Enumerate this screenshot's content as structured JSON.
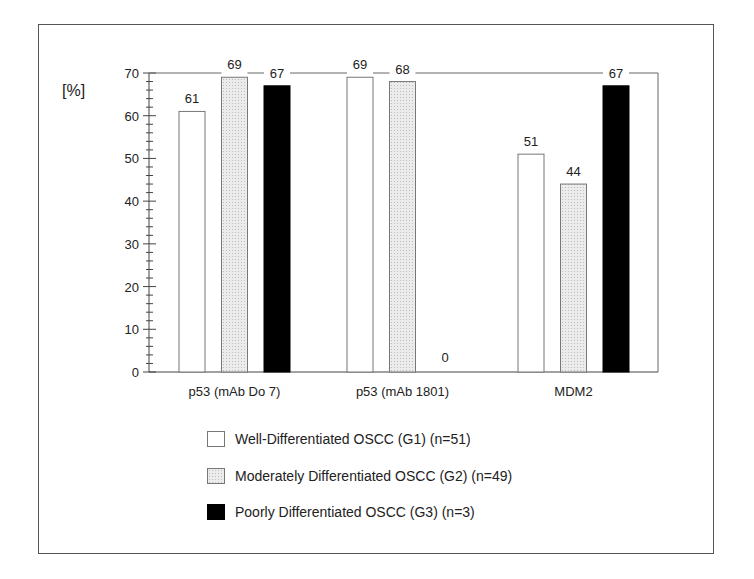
{
  "chart_data": {
    "type": "bar",
    "title": "",
    "xlabel": "",
    "ylabel": "[%]",
    "ylim": [
      0,
      70
    ],
    "yticks": [
      0,
      10,
      20,
      30,
      40,
      50,
      60,
      70
    ],
    "grid": false,
    "legend_position": "bottom",
    "categories": [
      "p53 (mAb Do 7)",
      "p53 (mAb 1801)",
      "MDM2"
    ],
    "series": [
      {
        "name": "Well-Differentiated OSCC (G1) (n=51)",
        "fill": "white",
        "values": [
          61,
          69,
          51
        ]
      },
      {
        "name": "Moderately Differentiated OSCC (G2) (n=49)",
        "fill": "dotted",
        "values": [
          69,
          68,
          44
        ]
      },
      {
        "name": "Poorly Differentiated OSCC (G3) (n=3)",
        "fill": "black",
        "values": [
          67,
          0,
          67
        ]
      }
    ],
    "data_labels": [
      [
        "61",
        "69",
        "51"
      ],
      [
        "69",
        "68",
        "44"
      ],
      [
        "67",
        "0",
        "67"
      ]
    ]
  },
  "legend": {
    "items": [
      {
        "label": "Well-Differentiated OSCC (G1) (n=51)",
        "swatch": "white"
      },
      {
        "label": "Moderately Differentiated OSCC (G2) (n=49)",
        "swatch": "dotted"
      },
      {
        "label": "Poorly Differentiated OSCC (G3) (n=3)",
        "swatch": "black"
      }
    ]
  },
  "colors": {
    "white": "#ffffff",
    "dotted": "#e6e6e6",
    "black": "#000000",
    "axis": "#444444"
  }
}
